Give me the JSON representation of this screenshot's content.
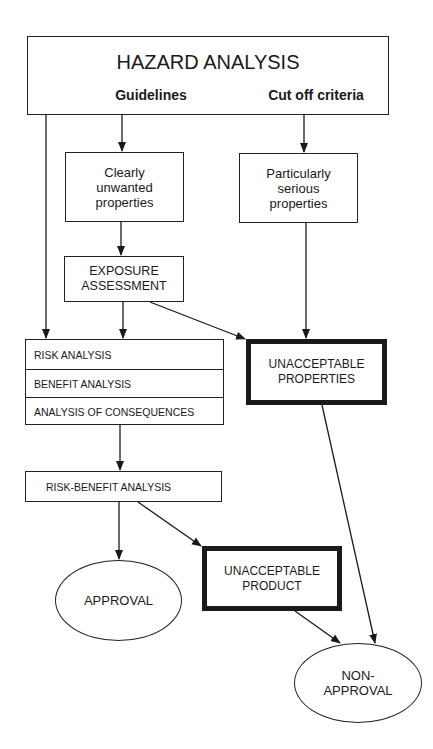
{
  "diagram": {
    "header": {
      "title": "HAZARD ANALYSIS",
      "left_label": "Guidelines",
      "right_label": "Cut off criteria"
    },
    "nodes": {
      "clearly_unwanted": [
        "Clearly",
        "unwanted",
        "properties"
      ],
      "particularly_serious": [
        "Particularly",
        "serious",
        "properties"
      ],
      "exposure_assessment": [
        "EXPOSURE",
        "ASSESSMENT"
      ],
      "analysis_stack": [
        "RISK ANALYSIS",
        "BENEFIT ANALYSIS",
        "ANALYSIS OF CONSEQUENCES"
      ],
      "unacceptable_properties": [
        "UNACCEPTABLE",
        "PROPERTIES"
      ],
      "risk_benefit": "RISK-BENEFIT ANALYSIS",
      "unacceptable_product": [
        "UNACCEPTABLE",
        "PRODUCT"
      ],
      "approval": "APPROVAL",
      "non_approval": [
        "NON-",
        "APPROVAL"
      ]
    },
    "edges": [
      [
        "Guidelines",
        "Clearly unwanted properties"
      ],
      [
        "Cut off criteria",
        "Particularly serious properties"
      ],
      [
        "Hazard Analysis",
        "Risk analysis stack"
      ],
      [
        "Clearly unwanted properties",
        "Exposure assessment"
      ],
      [
        "Exposure assessment",
        "Risk analysis stack"
      ],
      [
        "Exposure assessment",
        "Unacceptable properties"
      ],
      [
        "Particularly serious properties",
        "Unacceptable properties"
      ],
      [
        "Risk analysis stack",
        "Risk-benefit analysis"
      ],
      [
        "Risk-benefit analysis",
        "Approval"
      ],
      [
        "Risk-benefit analysis",
        "Unacceptable product"
      ],
      [
        "Unacceptable product",
        "Non-approval"
      ],
      [
        "Unacceptable properties",
        "Non-approval"
      ]
    ]
  }
}
